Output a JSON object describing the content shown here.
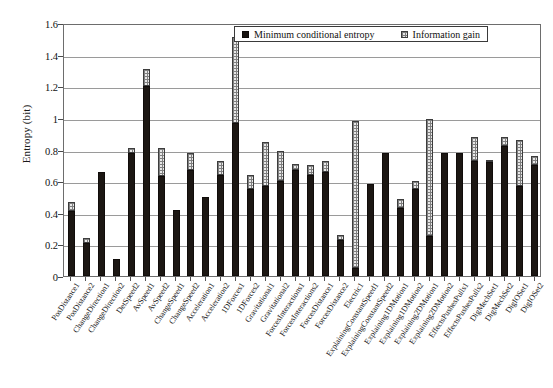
{
  "chart_data": {
    "type": "bar",
    "stacked": true,
    "title": "",
    "xlabel": "",
    "ylabel": "Entropy (bit)",
    "ylim": [
      0,
      1.6
    ],
    "yticks": [
      0,
      0.2,
      0.4,
      0.6,
      0.8,
      1,
      1.2,
      1.4,
      1.6
    ],
    "ytick_labels": [
      "0",
      "0.2",
      "0.4",
      "0.6",
      "0.8",
      "1",
      "1.2",
      "1.4",
      "1.6"
    ],
    "grid": true,
    "legend_position": "top-center",
    "categories": [
      "PosDistance1",
      "PosDistance2",
      "ChangeDirection1",
      "ChangeDirection2",
      "DetSpeed2",
      "AvSpeed1",
      "AvSpeed2",
      "ChangeSpeed1",
      "ChangeSpeed2",
      "Acceleration1",
      "Acceleration2",
      "1DForces1",
      "1DForces2",
      "Gravitational1",
      "Gravitational2",
      "ForcesInteractions1",
      "ForcesInteractions2",
      "ForcesDistance1",
      "ForcesDistance2",
      "Electric1",
      "ExplainingConstantSpeed1",
      "ExplainingConstantSpeed2",
      "Explaining1DMotion1",
      "Explaining1DMotion2",
      "Explaining2DMotion1",
      "Explaining2DMotion2",
      "EffectsPushesPulls1",
      "EffectsPushesPulls2",
      "DigMechSet1",
      "DigMechSet2",
      "DigIOSet1",
      "DigIOSet2"
    ],
    "series": [
      {
        "name": "Minimum conditional entropy",
        "color": "#1c1713",
        "values": [
          0.41,
          0.21,
          0.66,
          0.11,
          0.78,
          1.2,
          0.63,
          0.42,
          0.67,
          0.5,
          0.64,
          0.97,
          0.55,
          0.57,
          0.6,
          0.67,
          0.64,
          0.66,
          0.23,
          0.05,
          0.58,
          0.78,
          0.43,
          0.55,
          0.25,
          0.78,
          0.78,
          0.73,
          0.72,
          0.82,
          0.57,
          0.7
        ]
      },
      {
        "name": "Information gain",
        "color": "#e8e8e8",
        "values": [
          0.06,
          0.03,
          0.0,
          0.0,
          0.03,
          0.11,
          0.18,
          0.0,
          0.11,
          0.0,
          0.09,
          0.54,
          0.09,
          0.28,
          0.19,
          0.04,
          0.06,
          0.07,
          0.03,
          0.93,
          0.0,
          0.0,
          0.06,
          0.05,
          0.74,
          0.0,
          0.0,
          0.15,
          0.01,
          0.06,
          0.29,
          0.06
        ]
      }
    ],
    "totals": [
      0.47,
      0.24,
      0.66,
      0.11,
      0.81,
      1.31,
      0.81,
      0.42,
      0.78,
      0.5,
      0.73,
      1.51,
      0.64,
      0.85,
      0.79,
      0.71,
      0.7,
      0.73,
      0.26,
      0.98,
      0.58,
      0.78,
      0.49,
      0.6,
      0.99,
      0.78,
      0.78,
      0.88,
      0.73,
      0.88,
      0.86,
      0.76
    ]
  },
  "legend": {
    "entries": [
      {
        "label": "Minimum conditional entropy",
        "swatch": "solid-black-square"
      },
      {
        "label": "Information gain",
        "swatch": "hatched-grey-square"
      }
    ]
  },
  "axis": {
    "y_title": "Entropy (bit)"
  }
}
